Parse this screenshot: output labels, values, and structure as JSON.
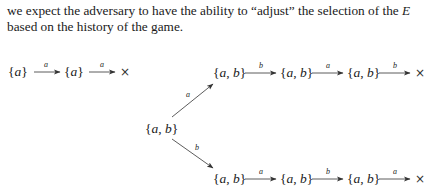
{
  "text": {
    "line1": "we expect the adversary to have the ability to “adjust” the selection of the ",
    "line1_cut": "E",
    "line2": "based on the history of the game."
  },
  "diagram": {
    "row_a": {
      "nodes": [
        "{a}",
        "{a}"
      ],
      "edges": [
        "a",
        "a"
      ],
      "terminal": "×"
    },
    "root": "{a, b}",
    "branch_top": {
      "edge_from_root": "a",
      "nodes": [
        "{a, b}",
        "{a, b}",
        "{a, b}"
      ],
      "edges": [
        "b",
        "a",
        "b"
      ],
      "terminal": "×"
    },
    "branch_bottom": {
      "edge_from_root": "b",
      "nodes": [
        "{a, b}",
        "{a, b}",
        "{a, b}"
      ],
      "edges": [
        "a",
        "b",
        "a"
      ],
      "terminal": "×"
    }
  }
}
